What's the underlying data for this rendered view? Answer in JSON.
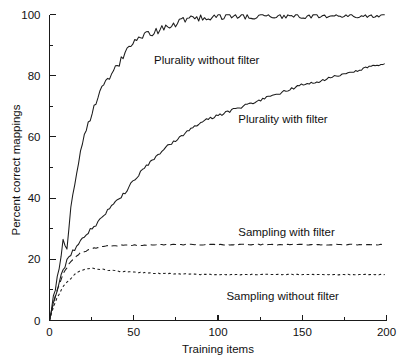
{
  "chart_data": {
    "type": "line",
    "title": "",
    "xlabel": "Training items",
    "ylabel": "Percent correct mappings",
    "xlim": [
      0,
      200
    ],
    "ylim": [
      0,
      100
    ],
    "grid": false,
    "legend_position": "inline-annotations",
    "xticks": [
      0,
      50,
      100,
      150,
      200
    ],
    "xtick_labels": [
      "0",
      "50",
      "100",
      "150",
      "200"
    ],
    "xticks_minor": [
      25,
      75,
      125,
      175
    ],
    "yticks": [
      0,
      20,
      40,
      60,
      80,
      100
    ],
    "ytick_labels": [
      "0",
      "20",
      "40",
      "60",
      "80",
      "100"
    ],
    "yticks_minor": [
      10,
      30,
      50,
      70,
      90
    ],
    "x": [
      0,
      2,
      4,
      6,
      8,
      10,
      12,
      14,
      16,
      18,
      20,
      25,
      30,
      35,
      40,
      45,
      50,
      55,
      60,
      65,
      70,
      75,
      80,
      85,
      90,
      95,
      100,
      110,
      120,
      130,
      140,
      150,
      160,
      170,
      180,
      190,
      200
    ],
    "series": [
      {
        "name": "Plurality without filter",
        "style": "solid",
        "label_x": 62,
        "label_y": 85,
        "values": [
          0,
          6,
          13,
          19,
          26,
          22,
          33,
          41,
          49,
          55,
          59,
          68,
          75,
          79,
          83,
          88,
          92,
          93,
          94,
          95,
          96,
          97,
          98,
          99,
          99,
          99.3,
          99.4,
          99.5,
          99.5,
          99.5,
          99.5,
          99.5,
          99.5,
          99.5,
          99.5,
          99.5,
          99.5
        ]
      },
      {
        "name": "Plurality with filter",
        "style": "solid",
        "label_x": 112,
        "label_y": 66,
        "values": [
          0,
          5,
          9,
          13,
          16,
          19,
          21,
          23,
          24,
          26,
          27,
          30,
          33,
          36,
          39,
          42,
          46,
          49,
          52,
          54,
          57,
          59,
          61,
          63,
          65,
          66,
          67,
          69,
          71,
          73,
          75,
          77,
          78,
          80,
          81,
          83,
          84
        ]
      },
      {
        "name": "Sampling with filter",
        "style": "dashed",
        "label_x": 112,
        "label_y": 29,
        "values": [
          0,
          5,
          9,
          12,
          15,
          17,
          19,
          20,
          21,
          22,
          22.5,
          23.5,
          24,
          24.3,
          24.5,
          24.6,
          24.7,
          24.7,
          24.8,
          24.8,
          24.8,
          24.8,
          24.8,
          24.8,
          24.8,
          24.8,
          24.8,
          24.8,
          24.8,
          24.8,
          24.8,
          24.8,
          24.8,
          24.8,
          24.8,
          24.8,
          24.8
        ]
      },
      {
        "name": "Sampling without filter",
        "style": "dotted",
        "label_x": 105,
        "label_y": 8,
        "values": [
          0,
          4,
          7,
          9,
          11,
          12.5,
          13.5,
          14.5,
          15.5,
          16.2,
          16.7,
          17,
          16.8,
          16.5,
          16.2,
          16,
          15.8,
          15.6,
          15.5,
          15.4,
          15.3,
          15.2,
          15.2,
          15.1,
          15.1,
          15,
          15,
          15,
          15,
          15,
          15,
          15,
          15,
          15,
          15,
          15,
          15
        ]
      }
    ]
  }
}
